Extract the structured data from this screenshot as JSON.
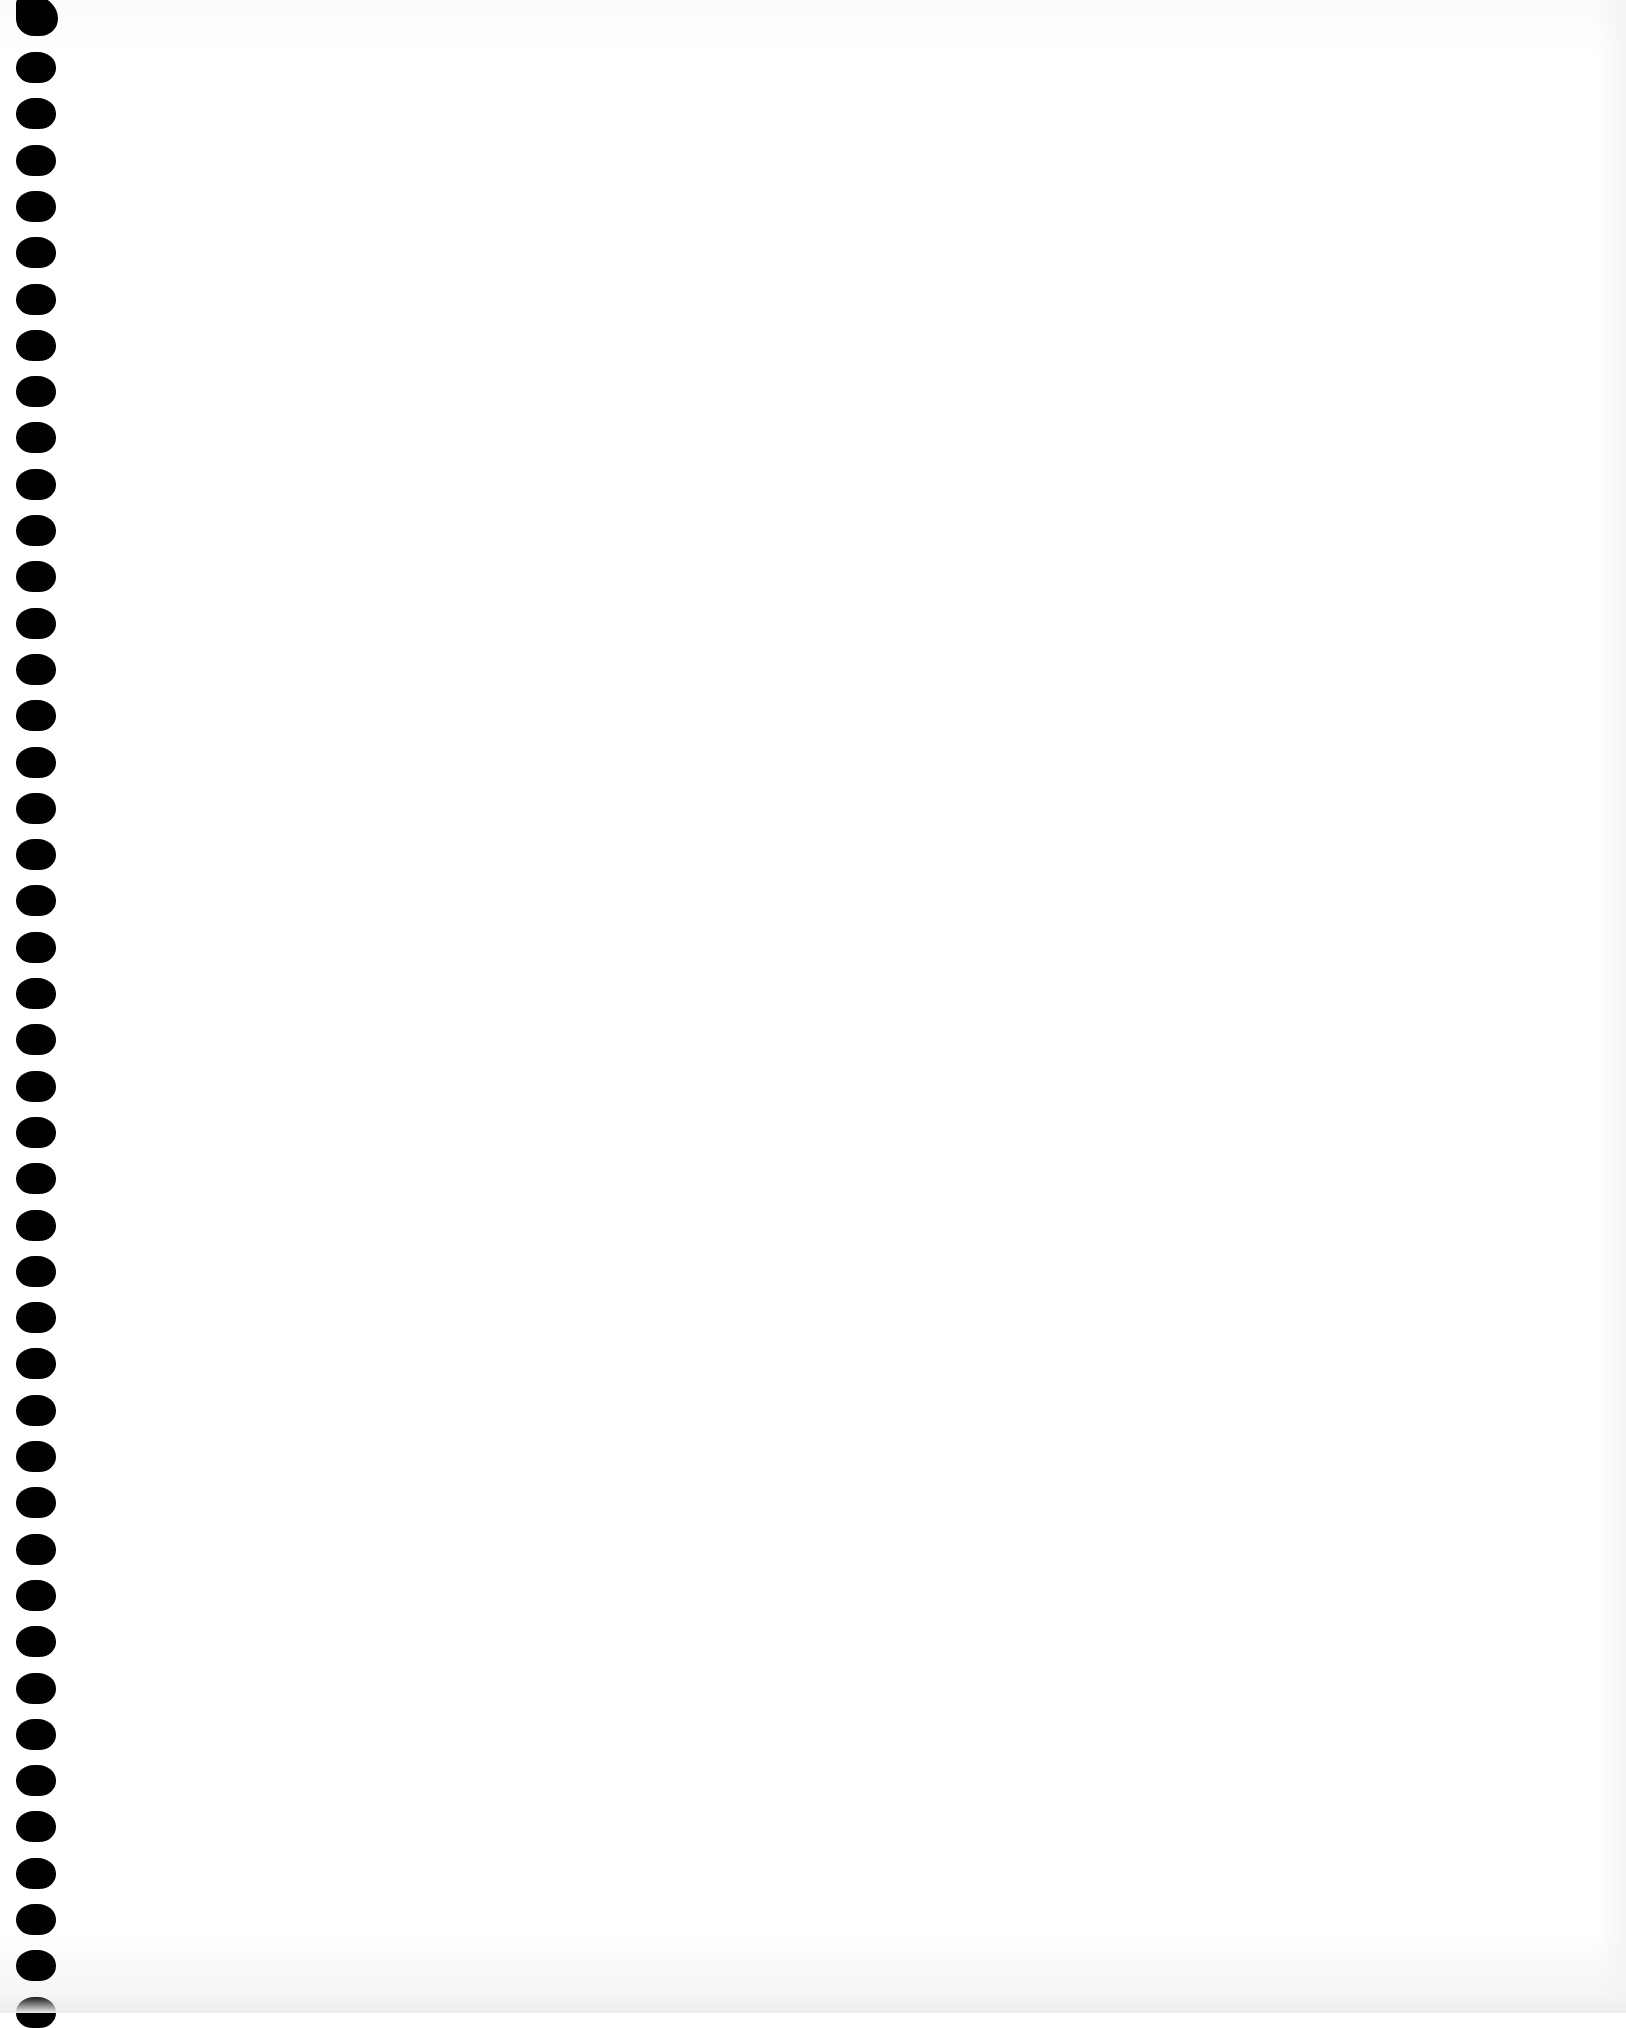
{
  "page": {
    "type": "blank-notebook-page",
    "binding": "spiral",
    "hole_count": 43,
    "hole_first_top": 52,
    "hole_spacing": 46.3,
    "content_text": ""
  }
}
